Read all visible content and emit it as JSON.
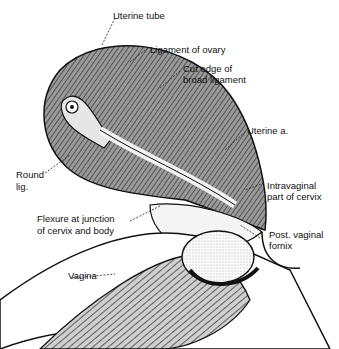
{
  "figure": {
    "type": "anatomical illustration",
    "labels": {
      "uterine_tube": "Uterine tube",
      "ligament_of_ovary": "Ligament of ovary",
      "cut_edge_1": "Cut edge of",
      "cut_edge_2": "broad ligament",
      "uterine_a": "Uterine a.",
      "round_lig_1": "Round",
      "round_lig_2": "lig.",
      "intravaginal_1": "Intravaginal",
      "intravaginal_2": "part of cervix",
      "flexure_1": "Flexure at junction",
      "flexure_2": "of cervix and body",
      "post_fornix_1": "Post. vaginal",
      "post_fornix_2": "fornix",
      "vagina": "Vagina"
    },
    "colors": {
      "ink": "#111111",
      "shade": "#8a8a8a",
      "light": "#d9d9d9",
      "background": "#ffffff"
    }
  }
}
